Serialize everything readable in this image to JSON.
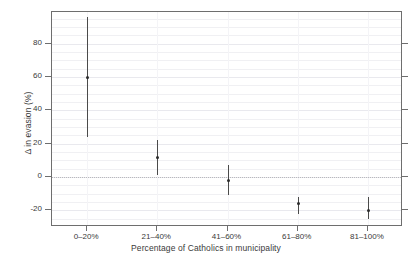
{
  "chart_data": {
    "type": "scatter",
    "title": "",
    "xlabel": "Percentage of Catholics in municipality",
    "ylabel": "Δ in evasion (%)",
    "categories": [
      "0–20%",
      "21–40%",
      "41–60%",
      "61–80%",
      "81–100%"
    ],
    "ytick_labels": [
      "80",
      "60",
      "40",
      "20",
      "0",
      "-20"
    ],
    "ytick_values": [
      80,
      60,
      40,
      20,
      0,
      -20
    ],
    "ylim": [
      -30,
      99
    ],
    "grid": true,
    "legend": null,
    "zero_reference_line": 0,
    "series": [
      {
        "name": "Δ in evasion (%)",
        "estimates": [
          60,
          12,
          -2,
          -16,
          -20
        ],
        "ci_low": [
          24,
          1,
          -11,
          -22,
          -25
        ],
        "ci_high": [
          96,
          22.5,
          7,
          -12,
          -12
        ]
      }
    ],
    "points": [
      {
        "category": "0–20%",
        "estimate": 60,
        "ci_low": 24,
        "ci_high": 96
      },
      {
        "category": "21–40%",
        "estimate": 12,
        "ci_low": 1,
        "ci_high": 22.5
      },
      {
        "category": "41–60%",
        "estimate": -2,
        "ci_low": -11,
        "ci_high": 7
      },
      {
        "category": "61–80%",
        "estimate": -16,
        "ci_low": -22,
        "ci_high": -12
      },
      {
        "category": "81–100%",
        "estimate": -20,
        "ci_low": -25,
        "ci_high": -12
      }
    ]
  },
  "colors": {
    "axis": "#6e6e6e",
    "grid": "#f0f0f3",
    "marker": "#2b2b2b",
    "errorbar": "#4a4a4a",
    "text": "#3a3a3a",
    "background": "#ffffff"
  }
}
